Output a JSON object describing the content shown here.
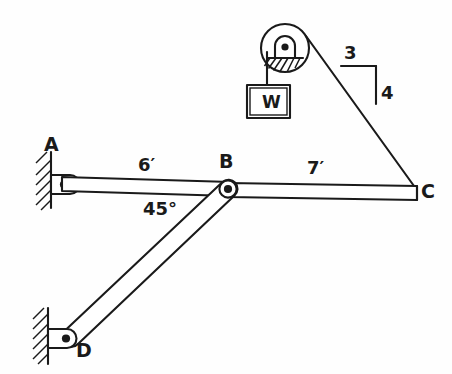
{
  "figure": {
    "kind": "statics-free-body-diagram",
    "background_color": "#fefefe",
    "line_color": "#1a1a1a"
  },
  "labels": {
    "point_a": "A",
    "point_b": "B",
    "point_c": "C",
    "point_d": "D",
    "weight": "W",
    "span_ab": "6′",
    "span_bc": "7′",
    "angle_bd": "45°",
    "slope_run": "3",
    "slope_rise": "4"
  },
  "geometry": {
    "beam_axis_y": 184,
    "point_a": {
      "x": 62,
      "y": 184
    },
    "point_b": {
      "x": 228,
      "y": 189
    },
    "point_c": {
      "x": 414,
      "y": 192
    },
    "point_d": {
      "x": 66,
      "y": 338
    },
    "pulley_center": {
      "x": 285,
      "y": 48
    },
    "pulley_radius": 24,
    "weight_block": {
      "x": 250,
      "y": 85,
      "w": 44,
      "h": 33
    },
    "cable_tangent_top": {
      "x": 305,
      "y": 36
    },
    "slope_triangle": {
      "corner_left": {
        "x": 341,
        "y": 66
      },
      "corner_right": {
        "x": 374,
        "y": 66
      },
      "corner_bottom": {
        "x": 374,
        "y": 103
      }
    }
  },
  "members": [
    {
      "name": "beam-ab",
      "from": "A",
      "to": "B",
      "length_label": "6′"
    },
    {
      "name": "beam-bc",
      "from": "B",
      "to": "C",
      "length_label": "7′"
    },
    {
      "name": "link-bd",
      "from": "B",
      "to": "D",
      "angle_label": "45°"
    },
    {
      "name": "cable-pulley-to-c",
      "from": "pulley",
      "to": "C",
      "slope": "3:4"
    }
  ],
  "supports": [
    {
      "name": "pin-support-a",
      "at": "A",
      "type": "pin",
      "label": "A"
    },
    {
      "name": "pin-support-d",
      "at": "D",
      "type": "pin",
      "label": "D"
    }
  ]
}
